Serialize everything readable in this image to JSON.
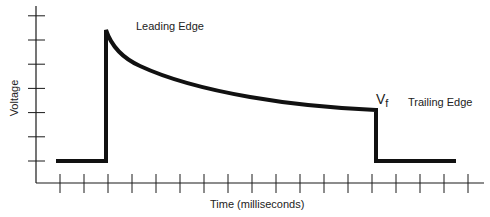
{
  "chart_data": {
    "type": "line",
    "title": "",
    "xlabel": "Time (milliseconds)",
    "ylabel": "Voltage",
    "grid": false,
    "legend": null,
    "x_ticks_count": 18,
    "y_ticks_count": 7,
    "x_tick_labels": [],
    "y_tick_labels": [],
    "annotations": [
      {
        "text": "Leading Edge",
        "near": "peak of rising edge"
      },
      {
        "text": "V",
        "subscript": "f",
        "near": "end of decay before falling edge"
      },
      {
        "text": "Trailing Edge",
        "near": "falling edge"
      }
    ],
    "series": [
      {
        "name": "pulse waveform",
        "description": "Baseline, sharp rise to peak at leading edge, exponential-like decay to Vf, sharp drop to baseline at trailing edge",
        "x_units": "tick index",
        "y_units": "tick index (0 = baseline tick)",
        "points": [
          [
            -0.2,
            0
          ],
          [
            2,
            0
          ],
          [
            2,
            5.4
          ],
          [
            2.5,
            4.7
          ],
          [
            3,
            4.2
          ],
          [
            4,
            3.8
          ],
          [
            6,
            3.2
          ],
          [
            8,
            2.7
          ],
          [
            10,
            2.4
          ],
          [
            12,
            2.2
          ],
          [
            13,
            2.1
          ],
          [
            13.1,
            2.1
          ],
          [
            13.1,
            0
          ],
          [
            16.5,
            0
          ]
        ]
      }
    ]
  },
  "labels": {
    "leading_edge": "Leading Edge",
    "trailing_edge": "Trailing Edge",
    "vf_main": "V",
    "vf_sub": "f",
    "x_axis": "Time (milliseconds)",
    "y_axis": "Voltage"
  },
  "colors": {
    "axis": "#1a1a1a",
    "signal": "#111111"
  }
}
